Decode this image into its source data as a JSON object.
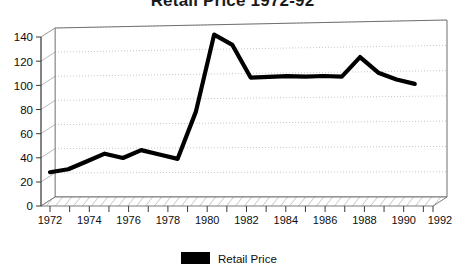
{
  "chart_data": {
    "type": "line",
    "title": "Retail Price 1972-92",
    "xlabel": "",
    "ylabel": "",
    "xlim": [
      1972,
      1993
    ],
    "ylim": [
      0,
      140
    ],
    "ytick_values": [
      0,
      20,
      40,
      60,
      80,
      100,
      120,
      140
    ],
    "ytick_labels": [
      "0",
      "20",
      "40",
      "60",
      "80",
      "100",
      "120",
      "140"
    ],
    "xtick_labels": [
      "1972",
      "1974",
      "1976",
      "1978",
      "1980",
      "1982",
      "1984",
      "1986",
      "1988",
      "1990",
      "1992"
    ],
    "xtick_values": [
      1972,
      1974,
      1976,
      1978,
      1980,
      1982,
      1984,
      1986,
      1988,
      1990,
      1992
    ],
    "minor_xticks_every": 1,
    "grid": "horizontal-dotted",
    "legend_position": "bottom-center",
    "style": "3d-perspective-box",
    "series": [
      {
        "name": "Retail Price",
        "color": "#000000",
        "x": [
          1972,
          1973,
          1974,
          1975,
          1976,
          1977,
          1978,
          1979,
          1980,
          1981,
          1982,
          1983,
          1984,
          1985,
          1986,
          1987,
          1988,
          1989,
          1990,
          1991,
          1992
        ],
        "values": [
          28,
          30,
          36,
          42,
          38,
          44,
          40,
          36,
          74,
          136,
          127,
          100,
          100,
          100,
          99,
          99,
          98,
          113,
          100,
          94,
          90
        ]
      }
    ]
  },
  "legend": {
    "entries": [
      {
        "label": "Retail Price",
        "swatch_color": "#000000"
      }
    ]
  },
  "colors": {
    "line": "#000000",
    "grid": "#b9b9b9",
    "axis": "#4d4d4d",
    "floor": "#ffffff",
    "background": "#ffffff"
  }
}
